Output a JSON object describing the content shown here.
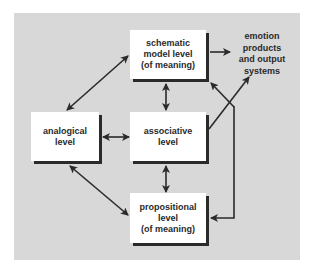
{
  "diagram": {
    "background_color": "#d8d8d8",
    "box_color": "#ffffff",
    "line_color": "#2a2a2a",
    "nodes": {
      "schematic": {
        "lines": [
          "schematic",
          "model level",
          "(of meaning)"
        ]
      },
      "analogical": {
        "lines": [
          "analogical",
          "level"
        ]
      },
      "associative": {
        "lines": [
          "associative",
          "level"
        ]
      },
      "propositional": {
        "lines": [
          "propositional",
          "level",
          "(of meaning)"
        ]
      },
      "output": {
        "lines": [
          "emotion",
          "products",
          "and output",
          "systems"
        ]
      }
    },
    "edges": [
      {
        "from": "analogical",
        "to": "schematic",
        "type": "bidirectional"
      },
      {
        "from": "analogical",
        "to": "associative",
        "type": "bidirectional"
      },
      {
        "from": "analogical",
        "to": "propositional",
        "type": "bidirectional"
      },
      {
        "from": "schematic",
        "to": "associative",
        "type": "bidirectional"
      },
      {
        "from": "associative",
        "to": "propositional",
        "type": "bidirectional"
      },
      {
        "from": "schematic",
        "to": "output",
        "type": "directed"
      },
      {
        "from": "associative",
        "to": "output",
        "type": "directed"
      },
      {
        "from": "associative",
        "to": "schematic",
        "type": "directed"
      },
      {
        "from": "associative",
        "to": "propositional",
        "type": "directed-loop"
      }
    ]
  }
}
